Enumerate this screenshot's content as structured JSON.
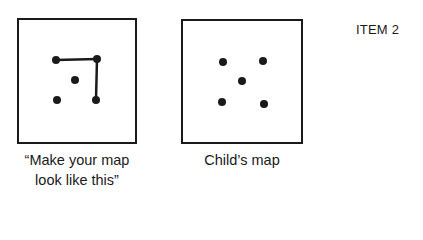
{
  "item_label": "ITEM 2",
  "maps": [
    {
      "name": "model-map",
      "caption_line1": "“Make your map",
      "caption_line2": "look like this”",
      "box": {
        "x": 17,
        "y": 18,
        "w": 120,
        "h": 126
      },
      "dots": [
        [
          56,
          60
        ],
        [
          97,
          59
        ],
        [
          75,
          80
        ],
        [
          57,
          100
        ],
        [
          96,
          100
        ]
      ],
      "lines": [
        [
          [
            56,
            60
          ],
          [
            97,
            59
          ]
        ],
        [
          [
            97,
            59
          ],
          [
            96,
            100
          ]
        ]
      ]
    },
    {
      "name": "child-map",
      "caption_line1": "Child’s map",
      "box": {
        "x": 181,
        "y": 19,
        "w": 122,
        "h": 125
      },
      "dots": [
        [
          223,
          62
        ],
        [
          263,
          61
        ],
        [
          242,
          81
        ],
        [
          222,
          102
        ],
        [
          264,
          104
        ]
      ],
      "lines": []
    }
  ]
}
